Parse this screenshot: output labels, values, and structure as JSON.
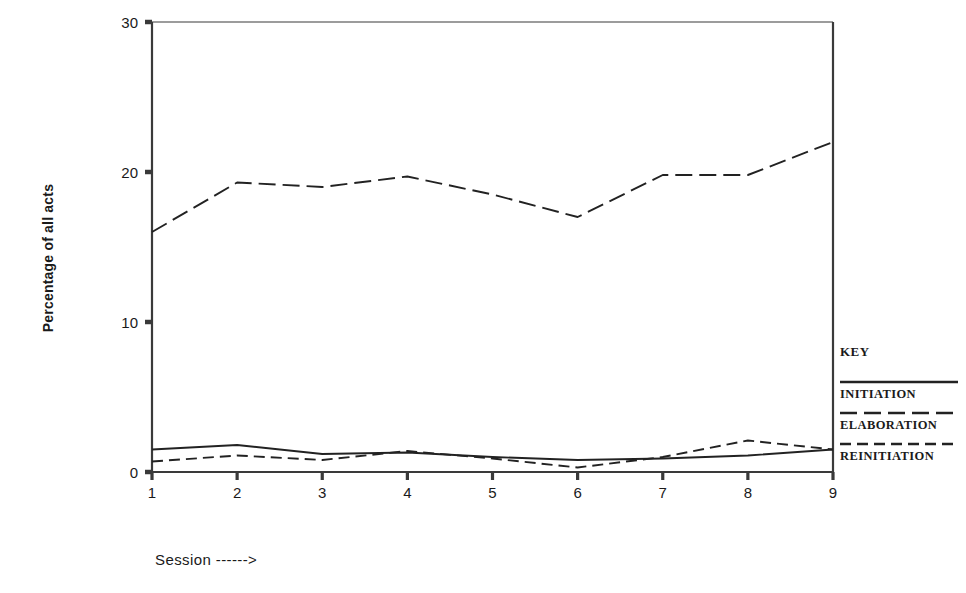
{
  "chart_data": {
    "type": "line",
    "title": "",
    "xlabel": "Session ------>",
    "ylabel": "Percentage of all acts",
    "categories": [
      1,
      2,
      3,
      4,
      5,
      6,
      7,
      8,
      9
    ],
    "x_tick_labels": [
      "1",
      "2",
      "3",
      "4",
      "5",
      "6",
      "7",
      "8",
      "9"
    ],
    "y_tick_labels": [
      "0",
      "10",
      "20",
      "30"
    ],
    "y_ticks": [
      0,
      10,
      20,
      30
    ],
    "ylim": [
      0,
      30
    ],
    "xlim": [
      1,
      9
    ],
    "grid": false,
    "legend_position": "right",
    "series": [
      {
        "name": "INITIATION",
        "style": "solid",
        "values": [
          1.5,
          1.8,
          1.2,
          1.3,
          1.0,
          0.8,
          0.9,
          1.1,
          1.5
        ]
      },
      {
        "name": "ELABORATION",
        "style": "long-dash",
        "values": [
          16.0,
          19.3,
          19.0,
          19.7,
          18.5,
          17.0,
          19.8,
          19.8,
          22.0
        ]
      },
      {
        "name": "REINITIATION",
        "style": "medium-dash",
        "values": [
          0.7,
          1.1,
          0.8,
          1.4,
          0.9,
          0.3,
          1.0,
          2.1,
          1.5
        ]
      }
    ]
  },
  "legend": {
    "title": "KEY",
    "entries": [
      {
        "label": "INITIATION",
        "style": "solid"
      },
      {
        "label": "ELABORATION",
        "style": "long-dash"
      },
      {
        "label": "REINITIATION",
        "style": "medium-dash"
      }
    ]
  },
  "axes": {
    "x_title": "Session ------>",
    "y_title": "Percentage of all acts"
  },
  "colors": {
    "line": "#222222",
    "axis": "#3a3a3a",
    "text": "#1a1a1a",
    "background": "#ffffff"
  }
}
